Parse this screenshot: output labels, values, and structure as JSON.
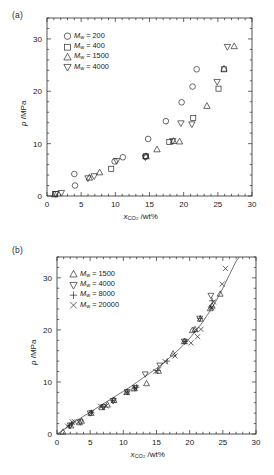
{
  "figure": {
    "panels": [
      {
        "tag": "(a)",
        "axis": {
          "xlabel_main": "x",
          "xlabel_sub": "CO",
          "xlabel_sub2": "2",
          "xlabel_unit": " /wt%",
          "ylabel_main": "p",
          "ylabel_unit": " /MPa",
          "xticks": [
            0,
            5,
            10,
            15,
            20,
            25,
            30
          ],
          "yticks": [
            0,
            10,
            20,
            30
          ],
          "xlim": [
            0,
            30
          ],
          "ylim": [
            0,
            34
          ],
          "xminor": 1,
          "yminor": 2
        },
        "legend": [
          {
            "symbol": "circle",
            "mw_label": "M",
            "mw_sub": "w",
            "value": " = 200"
          },
          {
            "symbol": "square",
            "mw_label": "M",
            "mw_sub": "w",
            "value": " = 400"
          },
          {
            "symbol": "triangle-up",
            "mw_label": "M",
            "mw_sub": "w",
            "value": " = 1500"
          },
          {
            "symbol": "triangle-down",
            "mw_label": "M",
            "mw_sub": "w",
            "value": " = 4000"
          }
        ]
      },
      {
        "tag": "(b)",
        "axis": {
          "xlabel_main": "x",
          "xlabel_sub": "CO",
          "xlabel_sub2": "2",
          "xlabel_unit": " /wt%",
          "ylabel_main": "p",
          "ylabel_unit": " /MPa",
          "xticks": [
            0,
            5,
            10,
            15,
            20,
            25,
            30
          ],
          "yticks": [
            0,
            10,
            20,
            30
          ],
          "xlim": [
            0,
            30
          ],
          "ylim": [
            0,
            34
          ],
          "xminor": 1,
          "yminor": 2
        },
        "legend": [
          {
            "symbol": "triangle-up",
            "mw_label": "M",
            "mw_sub": "w",
            "value": " = 1500"
          },
          {
            "symbol": "triangle-down",
            "mw_label": "M",
            "mw_sub": "w",
            "value": " = 4000"
          },
          {
            "symbol": "plus",
            "mw_label": "M",
            "mw_sub": "w",
            "value": " = 8000"
          },
          {
            "symbol": "cross",
            "mw_label": "M",
            "mw_sub": "w",
            "value": " = 20000"
          }
        ]
      }
    ]
  },
  "chart_data": [
    {
      "type": "scatter",
      "panel": "(a)",
      "title": "",
      "xlabel": "x_CO2 /wt%",
      "ylabel": "p /MPa",
      "xlim": [
        0,
        30
      ],
      "ylim": [
        0,
        34
      ],
      "grid": false,
      "legend_position": "upper-left",
      "series": [
        {
          "name": "Mw = 200",
          "marker": "circle",
          "points": [
            [
              4.0,
              4.2
            ],
            [
              4.1,
              2.0
            ],
            [
              9.9,
              6.6
            ],
            [
              11.1,
              7.4
            ],
            [
              14.4,
              7.5
            ],
            [
              14.8,
              10.9
            ],
            [
              17.4,
              14.3
            ],
            [
              19.7,
              17.9
            ],
            [
              21.3,
              20.9
            ],
            [
              21.9,
              24.2
            ]
          ]
        },
        {
          "name": "Mw = 400",
          "marker": "square",
          "points": [
            [
              1.2,
              0.35
            ],
            [
              9.4,
              5.2
            ],
            [
              14.5,
              7.6
            ],
            [
              17.9,
              10.3
            ],
            [
              21.4,
              14.9
            ],
            [
              25.1,
              20.5
            ],
            [
              25.9,
              24.2
            ]
          ]
        },
        {
          "name": "Mw = 1500",
          "marker": "triangle-up",
          "points": [
            [
              1.1,
              0.3
            ],
            [
              6.2,
              3.5
            ],
            [
              7.7,
              4.5
            ],
            [
              14.5,
              7.6
            ],
            [
              16.1,
              8.9
            ],
            [
              18.5,
              10.5
            ],
            [
              19.4,
              10.4
            ],
            [
              23.4,
              17.2
            ],
            [
              25.9,
              24.3
            ],
            [
              27.4,
              28.6
            ]
          ]
        },
        {
          "name": "Mw = 4000",
          "marker": "triangle-down",
          "points": [
            [
              1.3,
              0.4
            ],
            [
              2.1,
              0.6
            ],
            [
              6.0,
              3.4
            ],
            [
              6.9,
              3.8
            ],
            [
              10.2,
              6.7
            ],
            [
              14.4,
              7.4
            ],
            [
              18.4,
              10.5
            ],
            [
              19.6,
              13.9
            ],
            [
              21.2,
              13.7
            ],
            [
              24.9,
              21.8
            ],
            [
              26.4,
              28.5
            ]
          ]
        }
      ]
    },
    {
      "type": "scatter",
      "panel": "(b)",
      "title": "",
      "xlabel": "x_CO2 /wt%",
      "ylabel": "p /MPa",
      "xlim": [
        0,
        30
      ],
      "ylim": [
        0,
        34
      ],
      "grid": false,
      "legend_position": "upper-left",
      "fit_curve": {
        "name": "correlation fit",
        "points": [
          [
            0.0,
            0.0
          ],
          [
            1.0,
            0.8
          ],
          [
            2.0,
            1.7
          ],
          [
            3.0,
            2.6
          ],
          [
            4.0,
            3.4
          ],
          [
            5.0,
            4.2
          ],
          [
            6.0,
            5.0
          ],
          [
            7.0,
            5.8
          ],
          [
            8.0,
            6.6
          ],
          [
            9.0,
            7.4
          ],
          [
            10.0,
            8.2
          ],
          [
            11.0,
            9.0
          ],
          [
            12.0,
            9.9
          ],
          [
            13.0,
            10.8
          ],
          [
            14.0,
            11.7
          ],
          [
            15.0,
            12.6
          ],
          [
            16.0,
            13.6
          ],
          [
            17.0,
            14.7
          ],
          [
            18.0,
            15.8
          ],
          [
            19.0,
            17.0
          ],
          [
            20.0,
            18.4
          ],
          [
            21.0,
            19.9
          ],
          [
            22.0,
            21.6
          ],
          [
            23.0,
            23.5
          ],
          [
            24.0,
            25.6
          ],
          [
            25.0,
            28.0
          ],
          [
            26.0,
            30.6
          ],
          [
            27.0,
            33.2
          ],
          [
            27.5,
            34.0
          ]
        ]
      },
      "series": [
        {
          "name": "Mw = 1500",
          "marker": "triangle-up",
          "points": [
            [
              0.9,
              0.4
            ],
            [
              2.1,
              1.6
            ],
            [
              3.4,
              2.2
            ],
            [
              3.7,
              2.5
            ],
            [
              5.1,
              4.0
            ],
            [
              6.8,
              5.1
            ],
            [
              7.6,
              5.6
            ],
            [
              8.6,
              6.5
            ],
            [
              10.5,
              8.0
            ],
            [
              11.6,
              8.7
            ],
            [
              13.5,
              9.7
            ],
            [
              15.3,
              12.1
            ],
            [
              17.5,
              15.4
            ],
            [
              19.2,
              17.8
            ],
            [
              20.4,
              19.9
            ],
            [
              20.8,
              20.1
            ],
            [
              21.6,
              22.1
            ],
            [
              23.1,
              24.1
            ],
            [
              23.4,
              24.6
            ],
            [
              24.6,
              26.9
            ]
          ]
        },
        {
          "name": "Mw = 4000",
          "marker": "triangle-down",
          "points": [
            [
              2.0,
              1.7
            ],
            [
              3.5,
              2.3
            ],
            [
              5.0,
              4.0
            ],
            [
              7.0,
              5.2
            ],
            [
              8.5,
              6.4
            ],
            [
              10.6,
              8.1
            ],
            [
              11.8,
              8.9
            ],
            [
              13.3,
              11.5
            ],
            [
              15.5,
              13.2
            ],
            [
              19.2,
              17.8
            ],
            [
              21.5,
              22.2
            ],
            [
              23.2,
              26.6
            ]
          ]
        },
        {
          "name": "Mw = 8000",
          "marker": "plus",
          "points": [
            [
              1.9,
              1.6
            ],
            [
              2.2,
              1.9
            ],
            [
              5.2,
              4.1
            ],
            [
              6.9,
              5.2
            ],
            [
              8.4,
              6.4
            ],
            [
              10.6,
              8.1
            ],
            [
              11.7,
              8.8
            ],
            [
              12.0,
              9.0
            ],
            [
              15.2,
              12.2
            ],
            [
              16.6,
              14.0
            ],
            [
              19.3,
              17.8
            ],
            [
              21.6,
              22.2
            ],
            [
              23.2,
              24.4
            ],
            [
              23.4,
              25.6
            ]
          ]
        },
        {
          "name": "Mw = 20000",
          "marker": "cross",
          "points": [
            [
              1.6,
              1.5
            ],
            [
              2.3,
              2.3
            ],
            [
              2.6,
              2.4
            ],
            [
              5.2,
              4.1
            ],
            [
              6.6,
              5.3
            ],
            [
              7.4,
              5.4
            ],
            [
              8.5,
              6.4
            ],
            [
              10.5,
              8.0
            ],
            [
              11.8,
              8.8
            ],
            [
              14.9,
              12.0
            ],
            [
              16.3,
              13.9
            ],
            [
              17.8,
              15.0
            ],
            [
              19.2,
              17.7
            ],
            [
              20.2,
              17.5
            ],
            [
              20.9,
              20.0
            ],
            [
              21.2,
              18.7
            ],
            [
              21.7,
              20.1
            ],
            [
              23.3,
              24.3
            ],
            [
              23.6,
              25.4
            ],
            [
              24.9,
              28.8
            ],
            [
              25.4,
              31.8
            ]
          ]
        }
      ]
    }
  ]
}
